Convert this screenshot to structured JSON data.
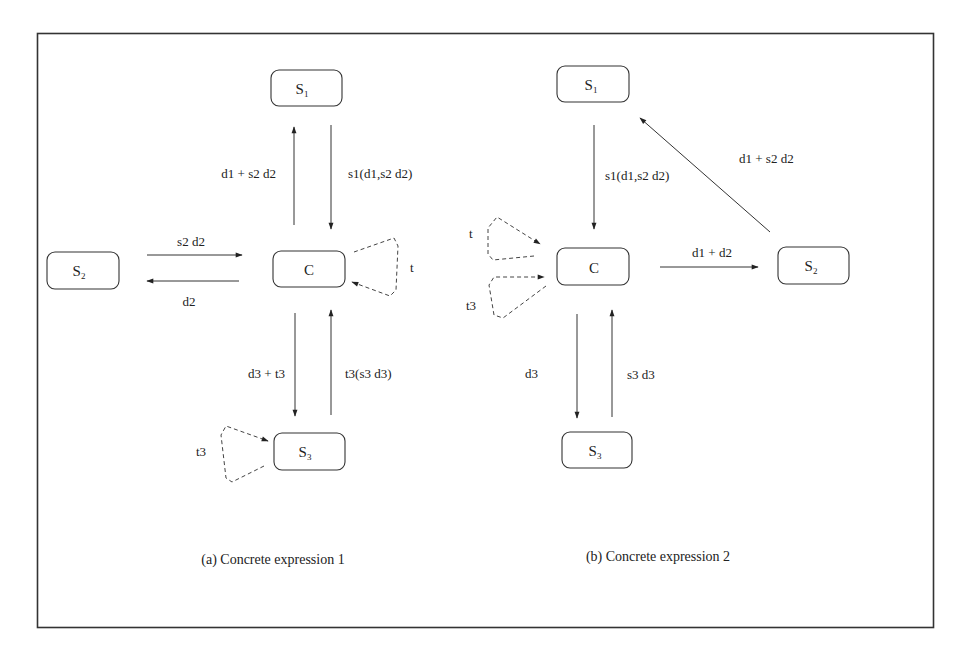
{
  "colors": {
    "line": "#333333",
    "background": "#ffffff"
  },
  "diagram_a": {
    "caption": "(a) Concrete expression 1",
    "nodes": {
      "s1": {
        "main": "S",
        "sub": "1"
      },
      "c": {
        "main": "C",
        "sub": ""
      },
      "s2": {
        "main": "S",
        "sub": "2"
      },
      "s3": {
        "main": "S",
        "sub": "3"
      }
    },
    "edges": {
      "c_to_s1": "d1 + s2 d2",
      "s1_to_c": "s1(d1,s2 d2)",
      "s2_to_c": "s2 d2",
      "c_to_s2": "d2",
      "c_to_s3": "d3 + t3",
      "s3_to_c": "t3(s3 d3)",
      "c_loop": "t",
      "s3_loop": "t3"
    }
  },
  "diagram_b": {
    "caption": "(b) Concrete expression 2",
    "nodes": {
      "s1": {
        "main": "S",
        "sub": "1"
      },
      "c": {
        "main": "C",
        "sub": ""
      },
      "s2": {
        "main": "S",
        "sub": "2"
      },
      "s3": {
        "main": "S",
        "sub": "3"
      }
    },
    "edges": {
      "s1_to_c": "s1(d1,s2 d2)",
      "s2_to_s1": "d1 + s2 d2",
      "c_to_s2": "d1 + d2",
      "c_to_s3": "d3",
      "s3_to_c": "s3 d3",
      "c_loop_t": "t",
      "c_loop_t3": "t3"
    }
  }
}
